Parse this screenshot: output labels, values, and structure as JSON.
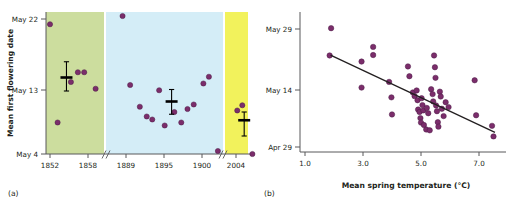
{
  "figure": {
    "background": "#ffffff",
    "marker_color": "#7b2d6b",
    "marker_edge": "#4a1b45",
    "axis_color": "#58595b",
    "line_color": "#231f20"
  },
  "panel_a": {
    "tag": "(a)",
    "y_axis_title": "Mean first flowering date",
    "y_ticks": [
      "May 22",
      "May 13",
      "May 4"
    ],
    "y_tick_values": [
      22,
      13,
      4
    ],
    "x_ticks": [
      "1852",
      "1858",
      "1889",
      "1895",
      "1900",
      "2004"
    ],
    "bands": [
      {
        "name": "historic-green",
        "color": "#ccdd9e"
      },
      {
        "name": "mid-blue",
        "color": "#d4edf7"
      },
      {
        "name": "recent-yellow",
        "color": "#f2f25c"
      }
    ],
    "axis_breaks": 2,
    "chart_data": {
      "type": "scatter",
      "title": "",
      "xlabel": "",
      "ylabel": "Mean first flowering date",
      "ylim": [
        4,
        22
      ],
      "y_tick_labels": [
        "May 22",
        "May 13",
        "May 4"
      ],
      "x_tick_labels": [
        "1852",
        "1858",
        "1889",
        "1895",
        "1900",
        "2004"
      ],
      "series": [
        {
          "name": "green-period-points",
          "x": [
            1852.0,
            1853.2,
            1855.3,
            1856.4,
            1857.4,
            1859.2
          ],
          "y": [
            21.3,
            8.2,
            13.6,
            14.9,
            14.9,
            12.7
          ]
        },
        {
          "name": "blue-period-points",
          "x": [
            1888.5,
            1889.6,
            1891.0,
            1892.0,
            1892.8,
            1893.8,
            1894.6,
            1896.0,
            1897.0,
            1897.9,
            1898.8,
            1900.2,
            1901.0,
            1902.3
          ],
          "y": [
            22.4,
            13.2,
            10.3,
            9.0,
            8.6,
            12.5,
            7.8,
            9.6,
            8.2,
            10.0,
            10.6,
            13.4,
            14.3,
            4.4
          ]
        },
        {
          "name": "yellow-period-points",
          "x": [
            2004.2,
            2005.0,
            2006.6
          ],
          "y": [
            9.8,
            10.5,
            4.0
          ]
        }
      ],
      "means": [
        {
          "name": "green-mean",
          "x": 1854.6,
          "y": 14.2,
          "err_low": 12.4,
          "err_high": 16.3
        },
        {
          "name": "blue-mean",
          "x": 1895.6,
          "y": 11.0,
          "err_low": 9.3,
          "err_high": 12.6
        },
        {
          "name": "yellow-mean",
          "x": 2005.3,
          "y": 8.5,
          "err_low": 6.4,
          "err_high": 9.6
        }
      ]
    }
  },
  "panel_b": {
    "tag": "(b)",
    "x_axis_title": "Mean spring temperature (°C)",
    "y_ticks": [
      "May 29",
      "May 14",
      "Apr 29"
    ],
    "x_ticks": [
      "1.0",
      "3.0",
      "5.0",
      "7.0"
    ],
    "chart_data": {
      "type": "scatter",
      "title": "",
      "xlabel": "Mean spring temperature (°C)",
      "ylabel": "",
      "xlim": [
        1.0,
        7.8
      ],
      "ylim": [
        0,
        32
      ],
      "y_tick_labels": [
        "May 29",
        "May 14",
        "Apr 29"
      ],
      "y_tick_values": [
        29,
        14,
        0
      ],
      "x_tick_values": [
        1.0,
        3.0,
        5.0,
        7.0
      ],
      "points": [
        [
          1.9,
          29.2
        ],
        [
          1.85,
          22.5
        ],
        [
          2.95,
          21.0
        ],
        [
          2.95,
          14.6
        ],
        [
          3.35,
          24.6
        ],
        [
          3.35,
          22.6
        ],
        [
          3.9,
          16.0
        ],
        [
          3.98,
          12.2
        ],
        [
          4.0,
          8.0
        ],
        [
          4.55,
          19.8
        ],
        [
          4.6,
          17.4
        ],
        [
          4.72,
          13.4
        ],
        [
          4.78,
          12.5
        ],
        [
          4.85,
          13.9
        ],
        [
          4.88,
          11.5
        ],
        [
          4.9,
          9.2
        ],
        [
          4.95,
          8.6
        ],
        [
          4.98,
          7.1
        ],
        [
          5.0,
          6.0
        ],
        [
          5.02,
          12.0
        ],
        [
          5.05,
          10.3
        ],
        [
          5.08,
          9.0
        ],
        [
          5.1,
          5.4
        ],
        [
          5.18,
          4.3
        ],
        [
          5.2,
          9.6
        ],
        [
          5.25,
          8.3
        ],
        [
          5.3,
          4.1
        ],
        [
          5.35,
          14.2
        ],
        [
          5.4,
          13.0
        ],
        [
          5.42,
          11.2
        ],
        [
          5.45,
          22.5
        ],
        [
          5.48,
          19.6
        ],
        [
          5.5,
          17.0
        ],
        [
          5.52,
          10.2
        ],
        [
          5.55,
          8.8
        ],
        [
          5.58,
          6.1
        ],
        [
          5.6,
          5.0
        ],
        [
          5.65,
          13.6
        ],
        [
          5.68,
          12.4
        ],
        [
          5.72,
          9.4
        ],
        [
          5.78,
          7.6
        ],
        [
          5.85,
          11.0
        ],
        [
          5.95,
          9.8
        ],
        [
          6.85,
          16.4
        ],
        [
          6.9,
          7.8
        ],
        [
          7.45,
          5.2
        ],
        [
          7.5,
          2.6
        ]
      ],
      "regression_line": {
        "x0": 1.88,
        "y0": 22.6,
        "x1": 7.55,
        "y1": 3.6
      }
    }
  }
}
